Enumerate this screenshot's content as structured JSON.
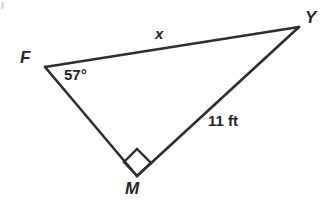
{
  "figure": {
    "type": "geometry-diagram",
    "shape": "right-triangle",
    "background_color": "#ffffff",
    "stroke_color": "#2e2e2e",
    "stroke_width": 2.6,
    "text_color": "#262626",
    "vertices": [
      {
        "name": "F",
        "label": "F",
        "x": 45,
        "y": 67,
        "label_x": 20,
        "label_y": 49
      },
      {
        "name": "Y",
        "label": "Y",
        "x": 299,
        "y": 27,
        "label_x": 305,
        "label_y": 9
      },
      {
        "name": "M",
        "label": "M",
        "x": 137,
        "y": 176,
        "label_x": 125,
        "label_y": 180
      }
    ],
    "sides": [
      {
        "name": "FY",
        "from": "F",
        "to": "Y",
        "label": "x",
        "label_x": 155,
        "label_y": 26,
        "style": "italic"
      },
      {
        "name": "MY",
        "from": "M",
        "to": "Y",
        "label": "11 ft",
        "label_x": 208,
        "label_y": 113,
        "style": "bold"
      },
      {
        "name": "FM",
        "from": "F",
        "to": "M",
        "label": "",
        "label_x": 0,
        "label_y": 0,
        "style": "none"
      }
    ],
    "angles": [
      {
        "at": "F",
        "label": "57°",
        "value": 57,
        "unit": "degrees",
        "label_x": 64,
        "label_y": 67
      },
      {
        "at": "M",
        "label": "",
        "value": 90,
        "unit": "degrees",
        "marker": "right-angle-square"
      }
    ],
    "right_angle_marker": {
      "vertex": "M",
      "shape": "square",
      "points": "137,176 124,162 137,149 151,163"
    }
  }
}
